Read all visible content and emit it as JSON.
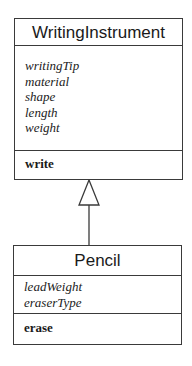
{
  "diagram": {
    "type": "uml-class-diagram",
    "classes": [
      {
        "name": "WritingInstrument",
        "attributes": [
          "writingTip",
          "material",
          "shape",
          "length",
          "weight"
        ],
        "operations": [
          "write"
        ]
      },
      {
        "name": "Pencil",
        "attributes": [
          "leadWeight",
          "eraserType"
        ],
        "operations": [
          "erase"
        ]
      }
    ],
    "relationships": [
      {
        "type": "generalization",
        "from": "Pencil",
        "to": "WritingInstrument"
      }
    ]
  },
  "colors": {
    "line": "#3a3a3a",
    "background": "#ffffff",
    "text": "#1a1a1a"
  }
}
